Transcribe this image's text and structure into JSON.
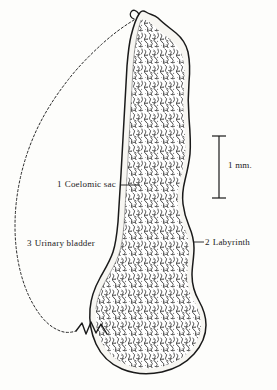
{
  "figure": {
    "kind": "anatomical-line-drawing",
    "background_color": "#fdfdfb",
    "ink_color": "#1a1a1a"
  },
  "labels": [
    {
      "id": "coelomic-sac",
      "number": "1",
      "text": "Coelomic sac",
      "leader": "horizontal-dash-right"
    },
    {
      "id": "urinary-bladder",
      "number": "3",
      "text": "Urinary bladder",
      "leader": "none"
    },
    {
      "id": "labyrinth",
      "number": "2",
      "text": "Labyrinth",
      "leader": "short-dash-left"
    }
  ],
  "scale_bar": {
    "id": "scale-bar",
    "text": "1 mm.",
    "orientation": "vertical",
    "cap_style": "serif-ends"
  },
  "regions": {
    "labyrinth": {
      "fill": "vermiculate-stipple",
      "outline": "solid"
    },
    "coelomic_sac": {
      "fill": "blank-margin",
      "outline": "solid"
    },
    "urinary_bladder": {
      "fill": "none",
      "outline": "dashed"
    },
    "duct": {
      "outline": "solid-zigzag"
    }
  }
}
